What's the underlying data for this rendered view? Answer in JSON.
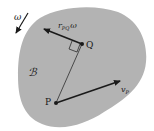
{
  "diagram": {
    "body_label": "ℬ",
    "angular_velocity_label": "ω",
    "point_p_label": "P",
    "point_q_label": "Q",
    "relative_velocity_label": {
      "main": "r",
      "subscript": "PQ",
      "suffix": "ω"
    },
    "velocity_p_label": {
      "main": "v",
      "subscript": "P"
    },
    "colors": {
      "body_fill": "#b3b3b3",
      "ink": "#1a1a1a",
      "background": "#ffffff"
    }
  }
}
